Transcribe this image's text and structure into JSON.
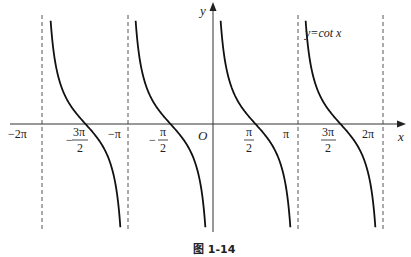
{
  "figure": {
    "title": "y=cot x",
    "caption": "图 1-14",
    "axis_x_label": "x",
    "axis_y_label": "y",
    "origin_label": "O",
    "colors": {
      "curve": "#111111",
      "axis": "#333333",
      "asymptote": "#555555"
    }
  },
  "ticks": [
    {
      "id": "m2pi",
      "text": "−2π",
      "type": "plain",
      "value": -6.2832
    },
    {
      "id": "m3pi2",
      "sign": "−",
      "num": "3π",
      "den": "2",
      "type": "frac",
      "value": -4.7124
    },
    {
      "id": "mpi",
      "text": "−π",
      "type": "plain",
      "value": -3.1416
    },
    {
      "id": "mpi2",
      "sign": "−",
      "num": "π",
      "den": "2",
      "type": "frac",
      "value": -1.5708
    },
    {
      "id": "pi2",
      "sign": "",
      "num": "π",
      "den": "2",
      "type": "frac",
      "value": 1.5708
    },
    {
      "id": "pi",
      "text": "π",
      "type": "plain",
      "value": 3.1416
    },
    {
      "id": "3pi2",
      "sign": "",
      "num": "3π",
      "den": "2",
      "type": "frac",
      "value": 4.7124
    },
    {
      "id": "2pi",
      "text": "2π",
      "type": "plain",
      "value": 6.2832
    }
  ],
  "asymptotes": [
    "x = -2π",
    "x = -π",
    "x = 0",
    "x = π",
    "x = 2π"
  ],
  "branches": [
    {
      "interval": "(-2π, -π)",
      "zero": "-3π/2"
    },
    {
      "interval": "(-π, 0)",
      "zero": "-π/2"
    },
    {
      "interval": "(0, π)",
      "zero": "π/2"
    },
    {
      "interval": "(π, 2π)",
      "zero": "3π/2"
    }
  ]
}
